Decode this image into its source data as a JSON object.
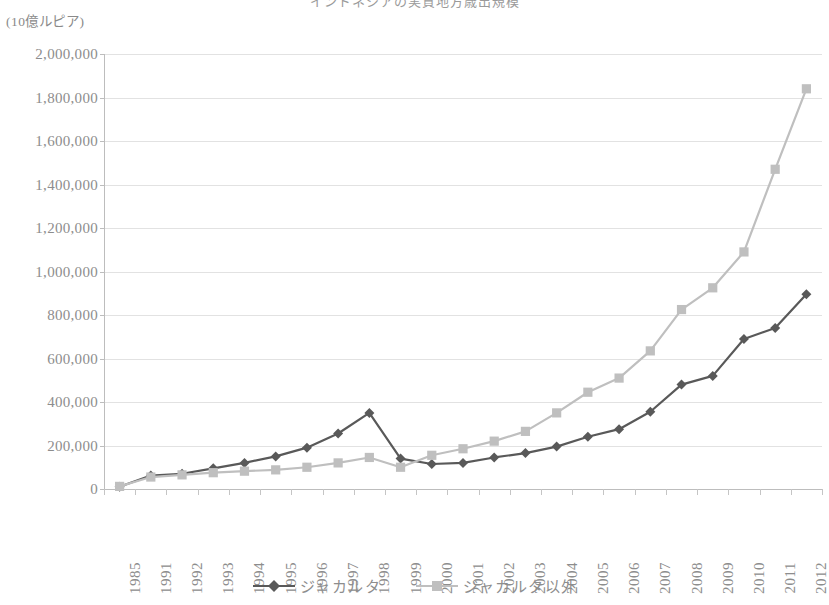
{
  "chart_data": {
    "type": "line",
    "title": "インドネシアの実質地方歳出規模",
    "ylabel": "(10億ルピア)",
    "xlabel": "",
    "grid": true,
    "legend_position": "bottom",
    "ylim": [
      0,
      2000000
    ],
    "ytick_step": 200000,
    "ytick_labels": [
      "2,000,000",
      "1,800,000",
      "1,600,000",
      "1,400,000",
      "1,200,000",
      "1,000,000",
      "800,000",
      "600,000",
      "400,000",
      "200,000",
      "0"
    ],
    "ytick_values": [
      2000000,
      1800000,
      1600000,
      1400000,
      1200000,
      1000000,
      800000,
      600000,
      400000,
      200000,
      0
    ],
    "categories": [
      "1985",
      "1991",
      "1992",
      "1993",
      "1994",
      "1995",
      "1996",
      "1997",
      "1998",
      "1999",
      "2000",
      "2001",
      "2002",
      "2003",
      "2004",
      "2005",
      "2006",
      "2007",
      "2008",
      "2009",
      "2010",
      "2011",
      "2012"
    ],
    "series": [
      {
        "name": "ジャカルタ",
        "color": "#595959",
        "marker": "diamond",
        "values": [
          10000,
          62000,
          70000,
          95000,
          120000,
          150000,
          190000,
          255000,
          350000,
          140000,
          115000,
          120000,
          145000,
          165000,
          195000,
          240000,
          275000,
          355000,
          480000,
          520000,
          690000,
          740000,
          895000
        ]
      },
      {
        "name": "ジャカルタ以外",
        "color": "#bfbfbf",
        "marker": "square",
        "values": [
          12000,
          55000,
          65000,
          75000,
          82000,
          88000,
          100000,
          120000,
          145000,
          100000,
          155000,
          185000,
          220000,
          265000,
          350000,
          445000,
          510000,
          635000,
          825000,
          925000,
          1090000,
          1470000,
          1840000
        ]
      }
    ]
  },
  "legend": {
    "entries": [
      {
        "label": "ジャカルタ",
        "color": "#595959",
        "marker": "diamond"
      },
      {
        "label": "ジャカルタ以外",
        "color": "#bfbfbf",
        "marker": "square"
      }
    ]
  }
}
